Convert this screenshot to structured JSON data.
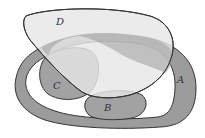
{
  "diagram": {
    "type": "venn-region-diagram",
    "sets": [
      {
        "id": "A",
        "label": "A",
        "shape": "ring band",
        "fill": "#9c9c9c"
      },
      {
        "id": "B",
        "label": "B",
        "shape": "blob bottom center",
        "fill": "#a2a2a2"
      },
      {
        "id": "C",
        "label": "C",
        "shape": "blob left",
        "fill": "#a2a2a2"
      },
      {
        "id": "D",
        "label": "D",
        "shape": "large oval top",
        "fill": "#e6e6e6"
      }
    ],
    "colors": {
      "outline": "#333333",
      "background": "#ffffff",
      "inner_white": "#ffffff"
    }
  }
}
